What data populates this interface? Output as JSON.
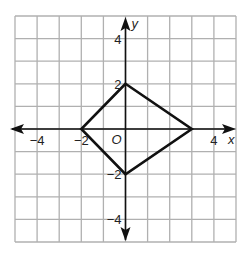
{
  "diagram": {
    "type": "coordinate-plane",
    "x_range": [
      -5,
      5
    ],
    "y_range": [
      -5,
      5
    ],
    "grid_step": 1,
    "axis_labels": {
      "x": "x",
      "y": "y"
    },
    "origin_label": "O",
    "x_ticks": [
      {
        "value": -4,
        "label": "−4"
      },
      {
        "value": -2,
        "label": "−2"
      },
      {
        "value": 4,
        "label": "4"
      }
    ],
    "y_ticks": [
      {
        "value": 4,
        "label": "4"
      },
      {
        "value": 2,
        "label": "2"
      },
      {
        "value": -2,
        "label": "−2"
      },
      {
        "value": -4,
        "label": "−4"
      }
    ],
    "polygon": {
      "name": "quadrilateral (kite)",
      "vertices": [
        [
          0,
          2
        ],
        [
          3,
          0
        ],
        [
          0,
          -2
        ],
        [
          -2,
          0
        ]
      ]
    },
    "colors": {
      "grid": "#b0b0b0",
      "axis": "#111111",
      "shape": "#111111"
    }
  }
}
